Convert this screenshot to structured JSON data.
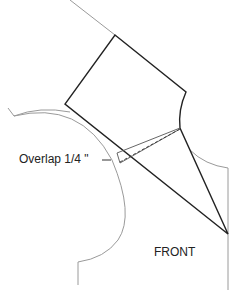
{
  "diagram": {
    "type": "sewing-pattern",
    "labels": {
      "overlap": "Overlap 1/4 \"",
      "piece": "FRONT"
    },
    "colors": {
      "outline": "#222222",
      "guide": "#999999"
    }
  }
}
